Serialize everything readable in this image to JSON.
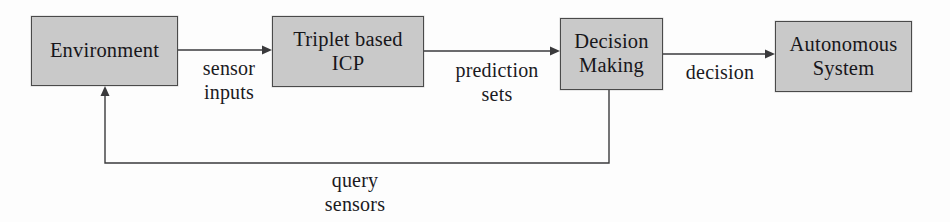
{
  "diagram": {
    "type": "block-flow-diagram",
    "colors": {
      "node_fill": "#c9c9c9",
      "node_border": "#4a4a4a",
      "text": "#17161a",
      "arrow": "#3a3a3c",
      "background": "#fdfdfd"
    },
    "nodes": [
      {
        "id": "environment",
        "line1": "Environment",
        "line2": ""
      },
      {
        "id": "triplet",
        "line1": "Triplet based",
        "line2": "ICP"
      },
      {
        "id": "decision",
        "line1": "Decision",
        "line2": "Making"
      },
      {
        "id": "autonomous",
        "line1": "Autonomous",
        "line2": "System"
      }
    ],
    "edges": [
      {
        "id": "sensor-inputs",
        "line1": "sensor",
        "line2": "inputs",
        "from": "environment",
        "to": "triplet"
      },
      {
        "id": "prediction-sets",
        "line1": "prediction",
        "line2": "sets",
        "from": "triplet",
        "to": "decision"
      },
      {
        "id": "decision-out",
        "line1": "decision",
        "line2": "",
        "from": "decision",
        "to": "autonomous"
      },
      {
        "id": "query-sensors",
        "line1": "query",
        "line2": "sensors",
        "from": "decision",
        "to": "environment"
      }
    ]
  }
}
